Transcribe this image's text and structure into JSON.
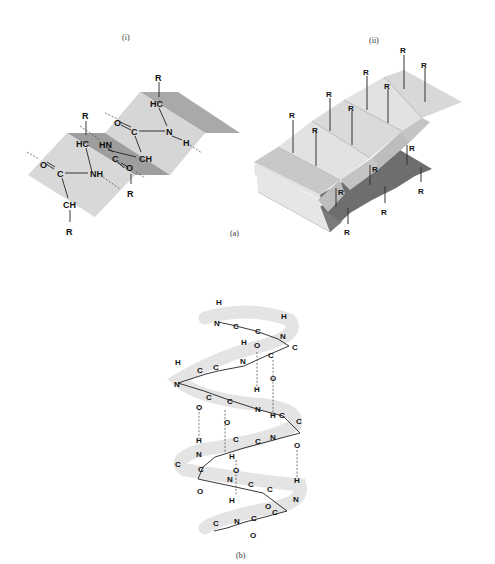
{
  "figure": {
    "panel_a": {
      "label": "(a)",
      "sub_i": {
        "label": "(i)",
        "atoms": {
          "r_top": "R",
          "hc_top": "HC",
          "o_top": "O",
          "c_top": "C",
          "n_top": "N",
          "h_top": "H",
          "r_mid": "R",
          "hc_mid": "HC",
          "hn_mid": "HN",
          "c_mid": "C",
          "o_mid": "O",
          "ch_mid": "CH",
          "r_mid2": "R",
          "o_left": "O",
          "c_left": "C",
          "nh_left": "NH",
          "ch_bot": "CH",
          "r_bot": "R"
        }
      },
      "sub_ii": {
        "label": "(ii)",
        "r_group_label": "R",
        "r_groups_count": 14
      }
    },
    "panel_b": {
      "label": "(b)",
      "atoms": {
        "h": "H",
        "n": "N",
        "c": "C",
        "o": "O"
      }
    }
  }
}
